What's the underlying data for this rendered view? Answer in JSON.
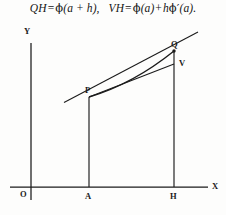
{
  "formula": {
    "full_text": "QH = ϕ(a + h),   VH = ϕ(a) + hϕ′(a).",
    "left_lhs": "QH",
    "left_eq": "=",
    "left_rhs_phi": "ϕ",
    "left_rhs_arg": "(a + h),",
    "right_lhs": "VH",
    "right_eq": "=",
    "right_phi1": "ϕ",
    "right_arg1": "(a)",
    "right_plus": "+",
    "right_h": "h",
    "right_phi2": "ϕ′",
    "right_arg2": "(a)."
  },
  "figure": {
    "axis_labels": {
      "y": "Y",
      "x": "X",
      "origin": "O"
    },
    "point_labels": {
      "p": "P",
      "q": "Q",
      "v": "V",
      "a": "A",
      "h": "H"
    },
    "colors": {
      "ink": "#1b1b1b",
      "background": "#fdfdfc"
    },
    "geometry": {
      "x_axis_y": 169,
      "y_axis_x": 31,
      "origin": [
        31,
        169
      ],
      "a_foot": [
        89,
        169
      ],
      "h_foot": [
        174,
        169
      ],
      "p": [
        89,
        79
      ],
      "q": [
        174,
        33
      ],
      "v": [
        174,
        46
      ],
      "tangent_start": [
        64,
        84
      ],
      "tangent_end": [
        198,
        14
      ],
      "curve_control": [
        132,
        67
      ],
      "x_axis_end": 208,
      "y_axis_top": 25
    }
  }
}
